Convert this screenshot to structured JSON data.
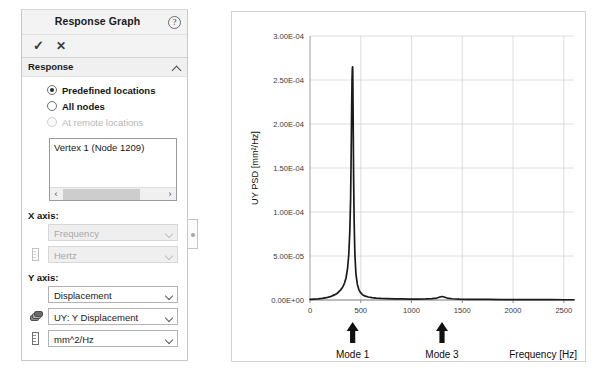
{
  "panel": {
    "title": "Response Graph",
    "help_icon": "help-circle-icon",
    "toolbar": {
      "accept_label": "✓",
      "cancel_label": "✕"
    },
    "section": {
      "title": "Response",
      "collapse_icon": "chevron-up-icon",
      "options": [
        {
          "label": "Predefined locations",
          "selected": true,
          "disabled": false
        },
        {
          "label": "All nodes",
          "selected": false,
          "disabled": false
        },
        {
          "label": "At remote locations",
          "selected": false,
          "disabled": true
        }
      ],
      "location_list": {
        "items": [
          "Vertex 1 (Node 1209)"
        ],
        "scroll_left_label": "‹",
        "scroll_right_label": "›"
      }
    },
    "x_axis": {
      "label": "X axis:",
      "quantity": {
        "value": "Frequency",
        "disabled": true,
        "icon": "none"
      },
      "unit": {
        "value": "Hertz",
        "disabled": true,
        "icon": "ruler-icon"
      }
    },
    "y_axis": {
      "label": "Y axis:",
      "quantity": {
        "value": "Displacement",
        "disabled": false,
        "icon": "none"
      },
      "component": {
        "value": "UY: Y Displacement",
        "disabled": false,
        "icon": "stack-icon"
      },
      "unit": {
        "value": "mm^2/Hz",
        "disabled": false,
        "icon": "ruler-icon"
      }
    }
  },
  "chart_data": {
    "type": "line",
    "title": "",
    "xlabel": "Frequency [Hz]",
    "ylabel": "UY PSD [mm²/Hz]",
    "xlim": [
      0,
      2600
    ],
    "ylim": [
      0,
      0.0003
    ],
    "grid": true,
    "legend": null,
    "xticks": [
      0,
      500,
      1000,
      1500,
      2000,
      2500
    ],
    "xticklabels": [
      "0",
      "500",
      "1000",
      "1500",
      "2000",
      "2500"
    ],
    "yticks": [
      0,
      5e-05,
      0.0001,
      0.00015,
      0.0002,
      0.00025,
      0.0003
    ],
    "yticklabels": [
      "0.00E+00",
      "5.00E-05",
      "1.00E-04",
      "1.50E-04",
      "2.00E-04",
      "2.50E-04",
      "3.00E-04"
    ],
    "series": [
      {
        "name": "UY PSD",
        "color": "#1a1a1a",
        "x": [
          0,
          40,
          80,
          120,
          160,
          200,
          240,
          270,
          300,
          320,
          340,
          355,
          370,
          382,
          392,
          400,
          406,
          410,
          414,
          417,
          419,
          420,
          421,
          423,
          426,
          430,
          435,
          442,
          452,
          466,
          482,
          500,
          520,
          545,
          575,
          610,
          650,
          700,
          760,
          830,
          900,
          980,
          1060,
          1140,
          1200,
          1250,
          1280,
          1300,
          1320,
          1350,
          1400,
          1470,
          1550,
          1650,
          1760,
          1880,
          2000,
          2120,
          2250,
          2380,
          2500,
          2600
        ],
        "y": [
          8e-07,
          1e-06,
          1.3e-06,
          1.8e-06,
          2.6e-06,
          3.8e-06,
          5.8e-06,
          7.8e-06,
          1.12e-05,
          1.42e-05,
          1.92e-05,
          2.5e-05,
          3.6e-05,
          5.2e-05,
          7.8e-05,
          0.000115,
          0.00017,
          0.000215,
          0.00025,
          0.000263,
          0.000265,
          0.0002648,
          0.00026,
          0.000238,
          0.00019,
          0.000135,
          8.8e-05,
          5.2e-05,
          3e-05,
          1.8e-05,
          1.15e-05,
          8e-06,
          5.8e-06,
          4.4e-06,
          3.4e-06,
          2.7e-06,
          2.2e-06,
          1.8e-06,
          1.5e-06,
          1.3e-06,
          1.2e-06,
          1.1e-06,
          1.1e-06,
          1.2e-06,
          1.5e-06,
          2.2e-06,
          3.4e-06,
          4e-06,
          3.4e-06,
          2.2e-06,
          1.4e-06,
          1e-06,
          8e-07,
          7e-07,
          6e-07,
          5e-07,
          5e-07,
          4e-07,
          4e-07,
          4e-07,
          3e-07,
          3e-07
        ]
      }
    ],
    "annotations": [
      {
        "name": "mode-1",
        "text": "Mode 1",
        "x": 420,
        "icon": "up-arrow-icon"
      },
      {
        "name": "mode-3",
        "text": "Mode 3",
        "x": 1300,
        "icon": "up-arrow-icon"
      }
    ]
  }
}
